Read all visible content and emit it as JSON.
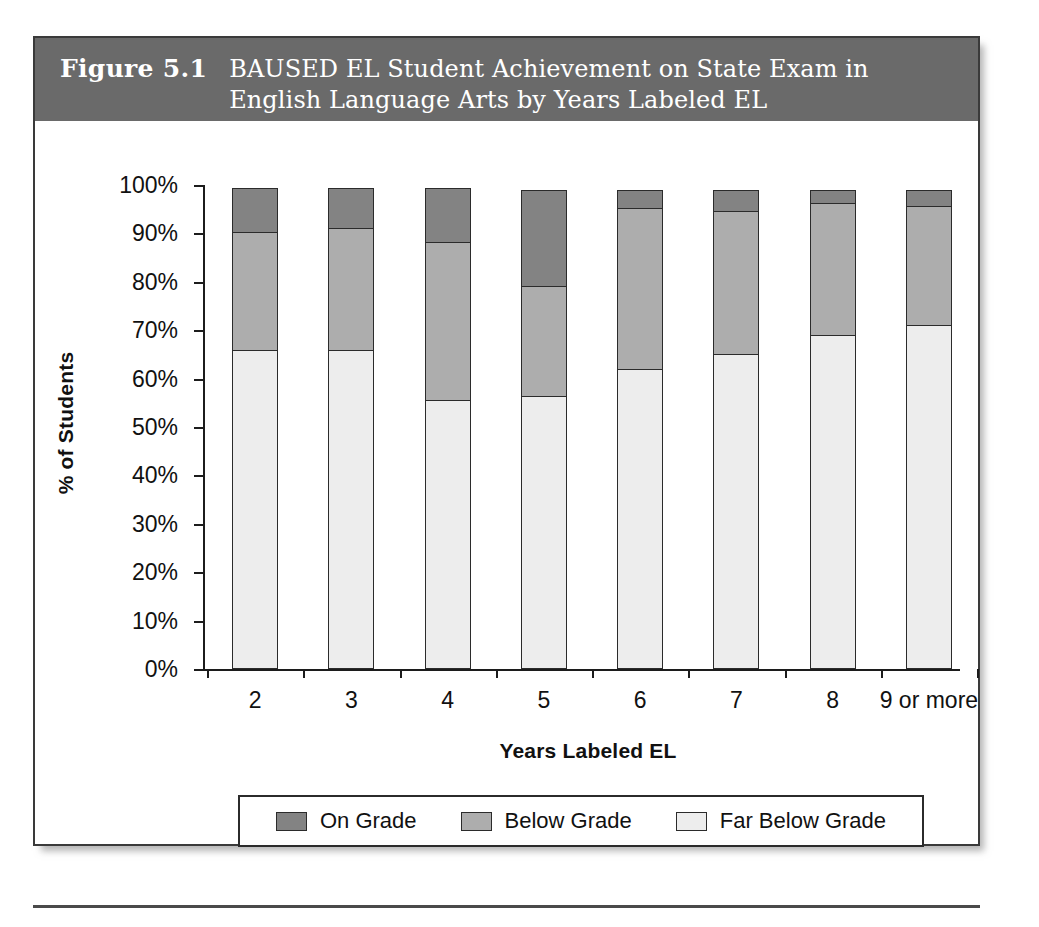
{
  "figure": {
    "number": "Figure 5.1",
    "title": "BAUSED EL Student Achievement on State Exam in English Language Arts by Years Labeled EL"
  },
  "axes": {
    "y_title": "% of Students",
    "x_title": "Years Labeled EL",
    "y_ticks": [
      "100%",
      "90%",
      "80%",
      "70%",
      "60%",
      "50%",
      "40%",
      "30%",
      "20%",
      "10%",
      "0%"
    ]
  },
  "legend": {
    "items": [
      {
        "label": "On Grade",
        "color": "#838383"
      },
      {
        "label": "Below Grade",
        "color": "#adadad"
      },
      {
        "label": "Far Below Grade",
        "color": "#ededed"
      }
    ]
  },
  "chart_data": {
    "type": "bar",
    "stacked": true,
    "title": "BAUSED EL Student Achievement on State Exam in English Language Arts by Years Labeled EL",
    "xlabel": "Years Labeled EL",
    "ylabel": "% of Students",
    "ylim": [
      0,
      100
    ],
    "grid": false,
    "legend_position": "bottom",
    "categories": [
      "2",
      "3",
      "4",
      "5",
      "6",
      "7",
      "8",
      "9 or more"
    ],
    "series": [
      {
        "name": "Far Below Grade",
        "color": "#ededed",
        "values": [
          66,
          66,
          55.5,
          56.5,
          62,
          65,
          69,
          71
        ]
      },
      {
        "name": "Below Grade",
        "color": "#adadad",
        "values": [
          24.5,
          25.5,
          33,
          23,
          33.5,
          30,
          27.5,
          25
        ]
      },
      {
        "name": "On Grade",
        "color": "#838383",
        "values": [
          9.5,
          8.5,
          11.5,
          20,
          4,
          4.5,
          3,
          3.5
        ]
      }
    ],
    "cumulative_tops": {
      "far_below_grade": [
        66,
        66,
        55.5,
        56.5,
        62,
        65,
        69,
        71
      ],
      "below_grade_top": [
        90.5,
        91.5,
        88.5,
        79.5,
        95.5,
        95,
        96.5,
        96
      ],
      "total": [
        100,
        100,
        100,
        99.5,
        99.5,
        99.5,
        99.5,
        99.5
      ]
    }
  }
}
